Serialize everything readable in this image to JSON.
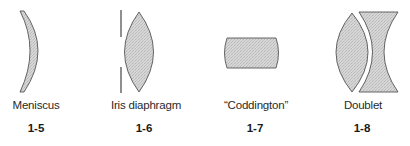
{
  "figures": [
    {
      "id": "1-5",
      "caption": "Meniscus",
      "number": "1-5"
    },
    {
      "id": "1-6",
      "caption": "Iris diaphragm",
      "number": "1-6"
    },
    {
      "id": "1-7",
      "caption": "“Coddington”",
      "number": "1-7"
    },
    {
      "id": "1-8",
      "caption": "Doublet",
      "number": "1-8"
    }
  ],
  "colors": {
    "lens_fill": "#cfcfcf",
    "lens_stroke": "#555555",
    "text": "#2a2a2a"
  }
}
